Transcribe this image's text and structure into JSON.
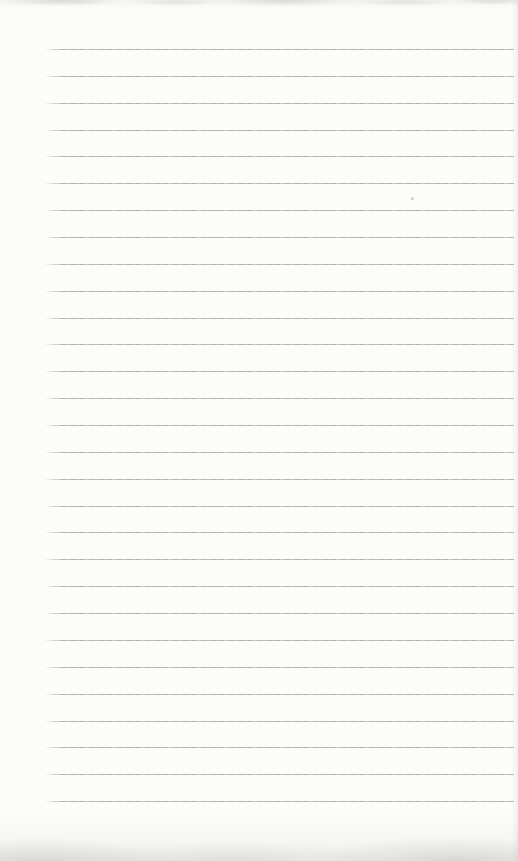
{
  "document": {
    "kind": "scanned blank ruled notebook page",
    "text_content": "",
    "paper_color": "#fcfcfa",
    "ruled_lines": {
      "count": 29,
      "color": "#a6a6a6",
      "first_line_y_px": 49,
      "spacing_px": 26.86,
      "left_margin_px": 45,
      "right_margin_px": 4
    },
    "speck": {
      "x_px": 411,
      "y_px": 197
    }
  }
}
